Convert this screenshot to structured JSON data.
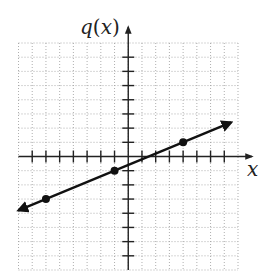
{
  "chart_data": {
    "type": "line",
    "title": "",
    "xlabel": "x",
    "ylabel": "q(x)",
    "xlim": [
      -8,
      8
    ],
    "ylim": [
      -8,
      8
    ],
    "grid": true,
    "tick_step": 1,
    "tick_labels": false,
    "series": [
      {
        "name": "q(x)",
        "equation": "q(x) = 0.4x - 0.6",
        "slope": 0.4,
        "intercept": -0.6,
        "x_range": [
          -8,
          7.5
        ],
        "arrows": "both",
        "points": [
          {
            "x": -6,
            "y": -3
          },
          {
            "x": -1,
            "y": -1
          },
          {
            "x": 4,
            "y": 1
          }
        ]
      }
    ]
  }
}
